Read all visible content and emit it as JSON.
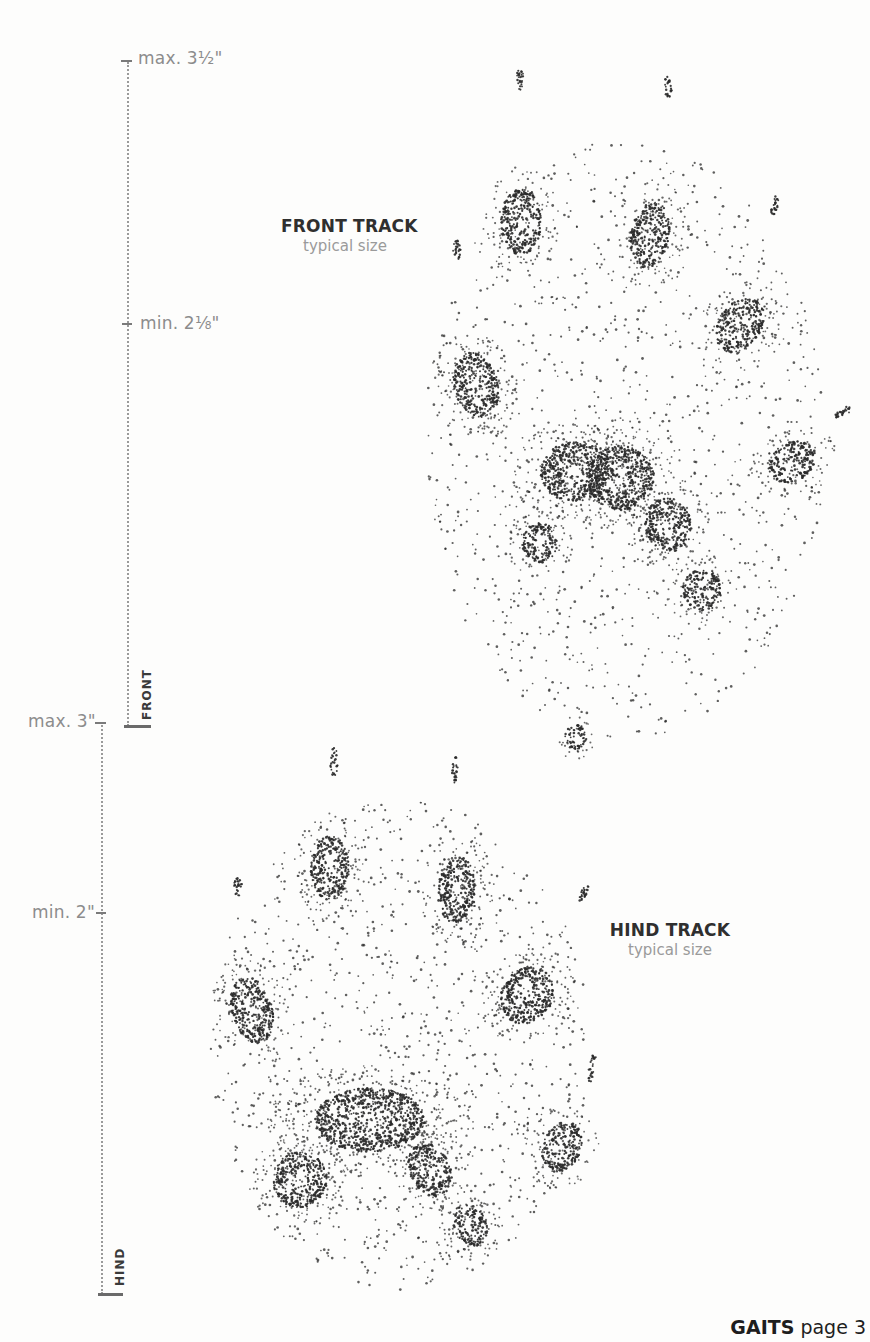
{
  "front_ruler": {
    "max_label": "max. 3½\"",
    "min_label": "min. 2⅛\"",
    "name": "FRONT"
  },
  "hind_ruler": {
    "max_label": "max. 3\"",
    "min_label": "min. 2\"",
    "name": "HIND"
  },
  "front_track": {
    "title": "FRONT TRACK",
    "subtitle": "typical size"
  },
  "hind_track": {
    "title": "HIND TRACK",
    "subtitle": "typical size"
  },
  "footer": {
    "section": "GAITS",
    "page_label": "page 3"
  },
  "illustration": {
    "front_track": {
      "pads": [
        {
          "cx": 521,
          "cy": 222,
          "rx": 20,
          "ry": 33,
          "rot": 0
        },
        {
          "cx": 650,
          "cy": 235,
          "rx": 19,
          "ry": 33,
          "rot": 10
        },
        {
          "cx": 740,
          "cy": 325,
          "rx": 21,
          "ry": 30,
          "rot": 35
        },
        {
          "cx": 476,
          "cy": 385,
          "rx": 22,
          "ry": 33,
          "rot": -15
        },
        {
          "cx": 792,
          "cy": 462,
          "rx": 25,
          "ry": 19,
          "rot": -30
        },
        {
          "cx": 575,
          "cy": 472,
          "rx": 34,
          "ry": 30,
          "rot": 0
        },
        {
          "cx": 620,
          "cy": 478,
          "rx": 34,
          "ry": 32,
          "rot": 0
        },
        {
          "cx": 668,
          "cy": 525,
          "rx": 23,
          "ry": 27,
          "rot": -20
        },
        {
          "cx": 540,
          "cy": 543,
          "rx": 18,
          "ry": 20,
          "rot": 0
        },
        {
          "cx": 702,
          "cy": 590,
          "rx": 19,
          "ry": 21,
          "rot": -20
        },
        {
          "cx": 576,
          "cy": 737,
          "rx": 11,
          "ry": 13,
          "rot": 0
        }
      ],
      "claws": [
        {
          "cx": 520,
          "cy": 80,
          "rx": 4,
          "ry": 11,
          "rot": 0
        },
        {
          "cx": 668,
          "cy": 87,
          "rx": 4,
          "ry": 11,
          "rot": 0
        },
        {
          "cx": 775,
          "cy": 205,
          "rx": 3,
          "ry": 11,
          "rot": 15
        },
        {
          "cx": 457,
          "cy": 250,
          "rx": 4,
          "ry": 10,
          "rot": 0
        },
        {
          "cx": 843,
          "cy": 412,
          "rx": 4,
          "ry": 10,
          "rot": 60
        }
      ],
      "spread": {
        "cx": 625,
        "cy": 440,
        "rx": 200,
        "ry": 300
      }
    },
    "hind_track": {
      "pads": [
        {
          "cx": 330,
          "cy": 868,
          "rx": 19,
          "ry": 32,
          "rot": 0
        },
        {
          "cx": 457,
          "cy": 890,
          "rx": 19,
          "ry": 33,
          "rot": 5
        },
        {
          "cx": 527,
          "cy": 995,
          "rx": 25,
          "ry": 30,
          "rot": 30
        },
        {
          "cx": 252,
          "cy": 1010,
          "rx": 20,
          "ry": 34,
          "rot": -15
        },
        {
          "cx": 562,
          "cy": 1147,
          "rx": 19,
          "ry": 26,
          "rot": 20
        },
        {
          "cx": 370,
          "cy": 1120,
          "rx": 55,
          "ry": 32,
          "rot": 0
        },
        {
          "cx": 300,
          "cy": 1180,
          "rx": 27,
          "ry": 28,
          "rot": 0
        },
        {
          "cx": 430,
          "cy": 1170,
          "rx": 20,
          "ry": 28,
          "rot": -25
        },
        {
          "cx": 470,
          "cy": 1225,
          "rx": 16,
          "ry": 22,
          "rot": -25
        }
      ],
      "claws": [
        {
          "cx": 334,
          "cy": 762,
          "rx": 4,
          "ry": 14,
          "rot": 0
        },
        {
          "cx": 455,
          "cy": 770,
          "rx": 3,
          "ry": 14,
          "rot": 0
        },
        {
          "cx": 238,
          "cy": 887,
          "rx": 4,
          "ry": 10,
          "rot": 0
        },
        {
          "cx": 584,
          "cy": 893,
          "rx": 3,
          "ry": 9,
          "rot": 25
        },
        {
          "cx": 592,
          "cy": 1068,
          "rx": 3,
          "ry": 15,
          "rot": 10
        }
      ],
      "spread": {
        "cx": 400,
        "cy": 1045,
        "rx": 190,
        "ry": 245
      }
    }
  }
}
